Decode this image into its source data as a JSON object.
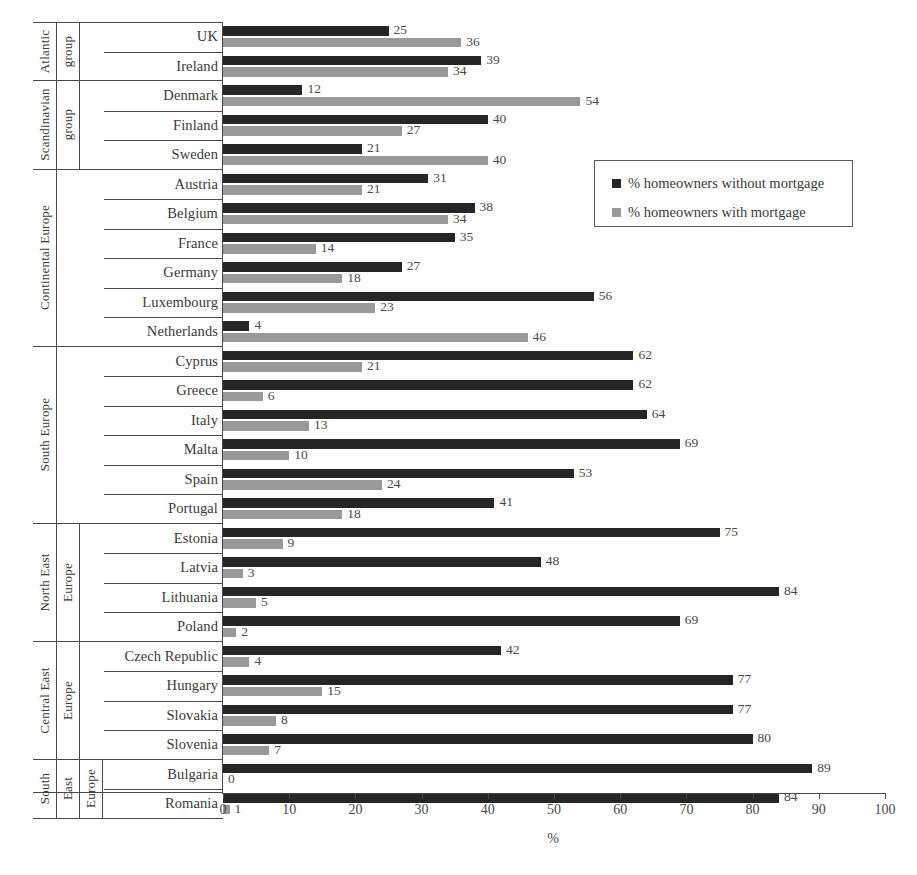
{
  "chart_data": {
    "type": "bar",
    "orientation": "horizontal",
    "title": "",
    "xlabel": "%",
    "ylabel": "",
    "xlim": [
      0,
      100
    ],
    "xticks": [
      0,
      10,
      20,
      30,
      40,
      50,
      60,
      70,
      80,
      90,
      100
    ],
    "grid": false,
    "legend_position": "upper right",
    "legend": [
      {
        "name": "% homeowners without mortgage",
        "color": "#262626"
      },
      {
        "name": "% homeowners with mortgage",
        "color": "#999999"
      }
    ],
    "series": [
      {
        "name": "% homeowners without mortgage",
        "color": "#262626",
        "values": [
          25,
          39,
          12,
          40,
          21,
          31,
          38,
          35,
          27,
          56,
          4,
          62,
          62,
          64,
          69,
          53,
          41,
          75,
          48,
          84,
          69,
          42,
          77,
          77,
          80,
          89,
          84
        ]
      },
      {
        "name": "% homeowners with mortgage",
        "color": "#999999",
        "values": [
          36,
          34,
          54,
          27,
          40,
          21,
          34,
          14,
          18,
          23,
          46,
          21,
          6,
          13,
          10,
          24,
          18,
          9,
          3,
          5,
          2,
          4,
          15,
          8,
          7,
          0,
          1
        ]
      }
    ],
    "categories": [
      "UK",
      "Ireland",
      "Denmark",
      "Finland",
      "Sweden",
      "Austria",
      "Belgium",
      "France",
      "Germany",
      "Luxembourg",
      "Netherlands",
      "Cyprus",
      "Greece",
      "Italy",
      "Malta",
      "Spain",
      "Portugal",
      "Estonia",
      "Latvia",
      "Lithuania",
      "Poland",
      "Czech Republic",
      "Hungary",
      "Slovakia",
      "Slovenia",
      "Bulgaria",
      "Romania"
    ],
    "groups": [
      {
        "label_lines": [
          "Atlantic",
          "group"
        ],
        "countries": [
          {
            "name": "UK",
            "without_mortgage": 25,
            "with_mortgage": 36
          },
          {
            "name": "Ireland",
            "without_mortgage": 39,
            "with_mortgage": 34
          }
        ]
      },
      {
        "label_lines": [
          "Scandinavian",
          "group"
        ],
        "countries": [
          {
            "name": "Denmark",
            "without_mortgage": 12,
            "with_mortgage": 54
          },
          {
            "name": "Finland",
            "without_mortgage": 40,
            "with_mortgage": 27
          },
          {
            "name": "Sweden",
            "without_mortgage": 21,
            "with_mortgage": 40
          }
        ]
      },
      {
        "label_lines": [
          "Continental Europe"
        ],
        "countries": [
          {
            "name": "Austria",
            "without_mortgage": 31,
            "with_mortgage": 21
          },
          {
            "name": "Belgium",
            "without_mortgage": 38,
            "with_mortgage": 34
          },
          {
            "name": "France",
            "without_mortgage": 35,
            "with_mortgage": 14
          },
          {
            "name": "Germany",
            "without_mortgage": 27,
            "with_mortgage": 18
          },
          {
            "name": "Luxembourg",
            "without_mortgage": 56,
            "with_mortgage": 23
          },
          {
            "name": "Netherlands",
            "without_mortgage": 4,
            "with_mortgage": 46
          }
        ]
      },
      {
        "label_lines": [
          "South Europe"
        ],
        "countries": [
          {
            "name": "Cyprus",
            "without_mortgage": 62,
            "with_mortgage": 21
          },
          {
            "name": "Greece",
            "without_mortgage": 62,
            "with_mortgage": 6
          },
          {
            "name": "Italy",
            "without_mortgage": 64,
            "with_mortgage": 13
          },
          {
            "name": "Malta",
            "without_mortgage": 69,
            "with_mortgage": 10
          },
          {
            "name": "Spain",
            "without_mortgage": 53,
            "with_mortgage": 24
          },
          {
            "name": "Portugal",
            "without_mortgage": 41,
            "with_mortgage": 18
          }
        ]
      },
      {
        "label_lines": [
          "North East",
          "Europe"
        ],
        "countries": [
          {
            "name": "Estonia",
            "without_mortgage": 75,
            "with_mortgage": 9
          },
          {
            "name": "Latvia",
            "without_mortgage": 48,
            "with_mortgage": 3
          },
          {
            "name": "Lithuania",
            "without_mortgage": 84,
            "with_mortgage": 5
          },
          {
            "name": "Poland",
            "without_mortgage": 69,
            "with_mortgage": 2
          }
        ]
      },
      {
        "label_lines": [
          "Central East",
          "Europe"
        ],
        "countries": [
          {
            "name": "Czech Republic",
            "without_mortgage": 42,
            "with_mortgage": 4
          },
          {
            "name": "Hungary",
            "without_mortgage": 77,
            "with_mortgage": 15
          },
          {
            "name": "Slovakia",
            "without_mortgage": 77,
            "with_mortgage": 8
          },
          {
            "name": "Slovenia",
            "without_mortgage": 80,
            "with_mortgage": 7
          }
        ]
      },
      {
        "label_lines": [
          "South",
          "East",
          "Europe"
        ],
        "countries": [
          {
            "name": "Bulgaria",
            "without_mortgage": 89,
            "with_mortgage": 0
          },
          {
            "name": "Romania",
            "without_mortgage": 84,
            "with_mortgage": 1
          }
        ]
      }
    ]
  }
}
